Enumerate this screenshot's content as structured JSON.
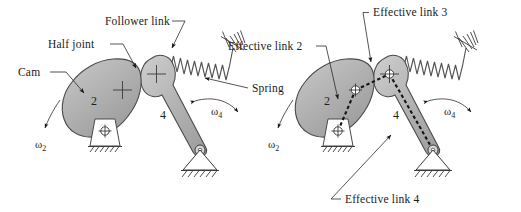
{
  "figure": {
    "background_color": "#ffffff",
    "body_fill_color": "#b2b2b2",
    "outline_color": "#4a4a4a",
    "ink_color": "#1a1a1a"
  },
  "left_diagram": {
    "name": "cam-follower-mechanism",
    "labels": {
      "cam": "Cam",
      "half_joint": "Half joint",
      "follower_link": "Follower link",
      "spring": "Spring"
    },
    "link_numbers": {
      "cam": "2",
      "follower": "4"
    },
    "omegas": {
      "cam": "ω",
      "cam_sub": "2",
      "follower": "ω",
      "follower_sub": "4"
    }
  },
  "right_diagram": {
    "name": "effective-linkage-equivalent",
    "labels": {
      "effective_link_2": "Effective link 2",
      "effective_link_3": "Effective link 3",
      "effective_link_4": "Effective link 4"
    },
    "link_numbers": {
      "cam": "2",
      "follower": "4"
    },
    "omegas": {
      "cam": "ω",
      "cam_sub": "2",
      "follower": "ω",
      "follower_sub": "4"
    }
  }
}
